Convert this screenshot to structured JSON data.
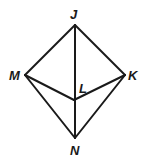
{
  "diagram": {
    "type": "geometry",
    "points": {
      "J": {
        "label": "J",
        "x": 75,
        "y": 25
      },
      "M": {
        "label": "M",
        "x": 25,
        "y": 75
      },
      "K": {
        "label": "K",
        "x": 125,
        "y": 75
      },
      "L": {
        "label": "L",
        "x": 74,
        "y": 100
      },
      "N": {
        "label": "N",
        "x": 75,
        "y": 138
      }
    },
    "segments": [
      "JM",
      "JK",
      "JN",
      "MN",
      "KN",
      "ML",
      "KL"
    ],
    "labels": {
      "J": "J",
      "M": "M",
      "K": "K",
      "L": "L",
      "N": "N"
    }
  }
}
